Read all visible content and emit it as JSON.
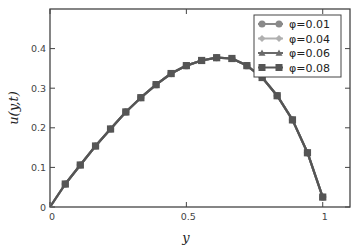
{
  "chart_data": {
    "type": "line",
    "title": "",
    "xlabel": "y",
    "ylabel": "u(y,t)",
    "xlim": [
      0,
      1.1
    ],
    "ylim": [
      0,
      0.5
    ],
    "xticks": [
      0,
      0.5,
      1
    ],
    "xtick_labels": [
      "0",
      "0.5",
      "1"
    ],
    "yticks": [
      0,
      0.1,
      0.2,
      0.3,
      0.4
    ],
    "ytick_labels": [
      "0",
      "0.1",
      "0.2",
      "0.3",
      "0.4"
    ],
    "grid": false,
    "legend_position": "upper right",
    "x": [
      0,
      0.056,
      0.111,
      0.167,
      0.222,
      0.278,
      0.333,
      0.389,
      0.444,
      0.5,
      0.556,
      0.611,
      0.667,
      0.722,
      0.778,
      0.833,
      0.889,
      0.944,
      1.0
    ],
    "series": [
      {
        "name": "φ=0.01",
        "color": "#8a8a8a",
        "marker": "circle",
        "values": [
          0,
          0.058,
          0.106,
          0.154,
          0.197,
          0.24,
          0.276,
          0.309,
          0.337,
          0.357,
          0.37,
          0.377,
          0.375,
          0.357,
          0.327,
          0.281,
          0.22,
          0.137,
          0.025
        ]
      },
      {
        "name": "φ=0.04",
        "color": "#b0b0b0",
        "marker": "diamond",
        "values": [
          0,
          0.058,
          0.106,
          0.154,
          0.197,
          0.24,
          0.276,
          0.309,
          0.337,
          0.357,
          0.37,
          0.377,
          0.375,
          0.357,
          0.327,
          0.281,
          0.22,
          0.137,
          0.025
        ]
      },
      {
        "name": "φ=0.06",
        "color": "#6a6a6a",
        "marker": "triangle",
        "values": [
          0,
          0.058,
          0.106,
          0.154,
          0.197,
          0.24,
          0.276,
          0.309,
          0.337,
          0.357,
          0.37,
          0.377,
          0.375,
          0.357,
          0.327,
          0.281,
          0.22,
          0.137,
          0.025
        ]
      },
      {
        "name": "φ=0.08",
        "color": "#555555",
        "marker": "square",
        "values": [
          0,
          0.058,
          0.106,
          0.154,
          0.197,
          0.24,
          0.276,
          0.309,
          0.337,
          0.357,
          0.37,
          0.377,
          0.375,
          0.357,
          0.327,
          0.281,
          0.22,
          0.137,
          0.025
        ]
      }
    ]
  }
}
